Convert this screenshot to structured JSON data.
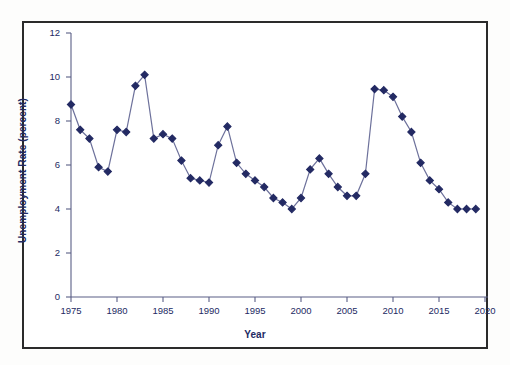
{
  "figure": {
    "background_color": "#ffffff",
    "frame_color": "#2b2b2b",
    "series_color": "#232a63",
    "axis_color": "#5a5f86"
  },
  "chart_data": {
    "type": "line",
    "title": "",
    "xlabel": "Year",
    "ylabel": "Unemployment Rate (percent)",
    "xlim": [
      1975,
      2020
    ],
    "ylim": [
      0,
      12
    ],
    "grid": false,
    "legend": null,
    "marker": "diamond",
    "xticks": [
      1975,
      1980,
      1985,
      1990,
      1995,
      2000,
      2005,
      2010,
      2015,
      2020
    ],
    "xtick_labels": [
      "1975",
      "1980",
      "1985",
      "1990",
      "1995",
      "2000",
      "2005",
      "2010",
      "2015",
      "2020"
    ],
    "yticks": [
      0,
      2,
      4,
      6,
      8,
      10,
      12
    ],
    "ytick_labels": [
      "0",
      "2",
      "4",
      "6",
      "8",
      "10",
      "12"
    ],
    "x": [
      1975,
      1976,
      1977,
      1978,
      1979,
      1980,
      1981,
      1982,
      1983,
      1984,
      1985,
      1986,
      1987,
      1988,
      1989,
      1990,
      1991,
      1992,
      1993,
      1994,
      1995,
      1996,
      1997,
      1998,
      1999,
      2000,
      2001,
      2002,
      2003,
      2004,
      2005,
      2006,
      2007,
      2008,
      2009,
      2010,
      2011,
      2012,
      2013,
      2014,
      2015,
      2016,
      2017,
      2018,
      2019
    ],
    "values": [
      8.75,
      7.6,
      7.2,
      5.9,
      5.7,
      7.6,
      7.5,
      9.6,
      10.1,
      7.2,
      7.4,
      7.2,
      6.2,
      5.4,
      5.3,
      5.2,
      6.9,
      7.75,
      6.1,
      5.6,
      5.3,
      5.0,
      4.5,
      4.3,
      4.0,
      4.5,
      5.8,
      6.3,
      5.6,
      5.0,
      4.6,
      4.6,
      5.6,
      9.45,
      9.4,
      9.1,
      8.2,
      7.5,
      6.1,
      5.3,
      4.9,
      4.3,
      4.0,
      4.0,
      4.0
    ],
    "series": [
      {
        "name": "Unemployment Rate",
        "values": [
          8.75,
          7.6,
          7.2,
          5.9,
          5.7,
          7.6,
          7.5,
          9.6,
          10.1,
          7.2,
          7.4,
          7.2,
          6.2,
          5.4,
          5.3,
          5.2,
          6.9,
          7.75,
          6.1,
          5.6,
          5.3,
          5.0,
          4.5,
          4.3,
          4.0,
          4.5,
          5.8,
          6.3,
          5.6,
          5.0,
          4.6,
          4.6,
          5.6,
          9.45,
          9.4,
          9.1,
          8.2,
          7.5,
          6.1,
          5.3,
          4.9,
          4.3,
          4.0,
          4.0,
          4.0
        ]
      }
    ]
  }
}
